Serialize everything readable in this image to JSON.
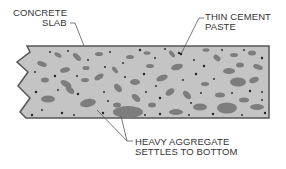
{
  "diagram": {
    "labels": {
      "concrete_slab": {
        "line1": "CONCRETE",
        "line2": "SLAB"
      },
      "thin_cement_paste": {
        "line1": "THIN CEMENT",
        "line2": "PASTE"
      },
      "heavy_aggregate": {
        "line1": "HEAVY AGGREGATE",
        "line2": "SETTLES TO BOTTOM"
      }
    },
    "colors": {
      "slab_fill": "#c4c4c4",
      "slab_border": "#555555",
      "aggregate": "#7d7d7d",
      "dots": "#222222",
      "leader_lines": "#555555",
      "text": "#333333"
    }
  }
}
